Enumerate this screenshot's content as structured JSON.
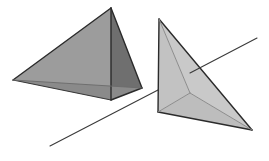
{
  "canvas": {
    "width": 269,
    "height": 161,
    "background": "#ffffff"
  },
  "palette": {
    "edge_dark": "#2b2b2b",
    "edge_mid": "#555555",
    "edge_light": "#8c8c8c",
    "line_stroke": "#3a3a3a",
    "left_face_left": "#9c9c9c",
    "left_face_right": "#6f6f6f",
    "left_face_bottom": "#8a8a8a",
    "right_face_upper": "#c9c9c9",
    "right_face_left": "#c2c2c2",
    "right_face_lower": "#bdbdbd",
    "right_face_sliver": "#b5b5b5"
  },
  "scene": {
    "title": "two-tetrahedra-with-intersecting-line",
    "description": "Two shaded tetrahedra in oblique projection with a single straight line crossing the scene from lower-left to upper-right."
  },
  "objects": {
    "left_tetrahedron": {
      "name": "left-tetrahedron",
      "vertices": {
        "apex": [
          111,
          8
        ],
        "left": [
          13,
          80
        ],
        "front": [
          111,
          100
        ],
        "right": [
          142,
          88
        ]
      },
      "faces": [
        {
          "name": "left-face",
          "points": "111,8 13,80 111,100",
          "fill": "#9c9c9c"
        },
        {
          "name": "right-face",
          "points": "111,8 111,100 142,88",
          "fill": "#6f6f6f"
        },
        {
          "name": "bottom-sliver-face",
          "points": "13,80 111,100 142,88",
          "fill": "#8a8a8a"
        }
      ],
      "edges": [
        {
          "name": "apex-to-left",
          "from": [
            111,
            8
          ],
          "to": [
            13,
            80
          ],
          "stroke": "#2b2b2b",
          "width": 1.4
        },
        {
          "name": "apex-to-front",
          "from": [
            111,
            8
          ],
          "to": [
            111,
            100
          ],
          "stroke": "#2b2b2b",
          "width": 1.4
        },
        {
          "name": "apex-to-right",
          "from": [
            111,
            8
          ],
          "to": [
            142,
            88
          ],
          "stroke": "#2b2b2b",
          "width": 1.4
        },
        {
          "name": "left-to-front",
          "from": [
            13,
            80
          ],
          "to": [
            111,
            100
          ],
          "stroke": "#3a3a3a",
          "width": 1.1
        },
        {
          "name": "front-to-right",
          "from": [
            111,
            100
          ],
          "to": [
            142,
            88
          ],
          "stroke": "#2b2b2b",
          "width": 1.4
        },
        {
          "name": "left-to-right-hidden",
          "from": [
            13,
            80
          ],
          "to": [
            142,
            88
          ],
          "stroke": "#6b6b6b",
          "width": 0.9
        }
      ]
    },
    "right_tetrahedron": {
      "name": "right-tetrahedron",
      "vertices": {
        "top": [
          159,
          19
        ],
        "bottom_left": [
          158,
          112
        ],
        "bottom_right": [
          252,
          130
        ],
        "interior": [
          190,
          93
        ]
      },
      "faces": [
        {
          "name": "upper-face",
          "points": "159,19 252,130 190,93",
          "fill": "#c9c9c9"
        },
        {
          "name": "left-face",
          "points": "159,19 158,112 190,93",
          "fill": "#c2c2c2"
        },
        {
          "name": "lower-face",
          "points": "158,112 252,130 190,93",
          "fill": "#bdbdbd"
        }
      ],
      "edges": [
        {
          "name": "top-to-bottom-left",
          "from": [
            159,
            19
          ],
          "to": [
            158,
            112
          ],
          "stroke": "#2b2b2b",
          "width": 1.4
        },
        {
          "name": "top-to-bottom-right",
          "from": [
            159,
            19
          ],
          "to": [
            252,
            130
          ],
          "stroke": "#2b2b2b",
          "width": 1.4
        },
        {
          "name": "bottom-left-to-bottom-right",
          "from": [
            158,
            112
          ],
          "to": [
            252,
            130
          ],
          "stroke": "#2b2b2b",
          "width": 1.4
        },
        {
          "name": "interior-to-top",
          "from": [
            190,
            93
          ],
          "to": [
            159,
            19
          ],
          "stroke": "#8c8c8c",
          "width": 1.0
        },
        {
          "name": "interior-to-bottom-left",
          "from": [
            190,
            93
          ],
          "to": [
            158,
            112
          ],
          "stroke": "#8c8c8c",
          "width": 1.0
        },
        {
          "name": "interior-to-bottom-right",
          "from": [
            190,
            93
          ],
          "to": [
            252,
            130
          ],
          "stroke": "#8c8c8c",
          "width": 1.0
        }
      ]
    },
    "crossing_line": {
      "name": "crossing-line",
      "from": [
        50,
        146
      ],
      "to": [
        257,
        38
      ],
      "stroke": "#3a3a3a",
      "width": 1.1,
      "occluded_segment": {
        "from": [
          158,
          90
        ],
        "to": [
          190,
          93
        ]
      }
    }
  },
  "chart_data": {
    "type": "scatter",
    "xlabel": "",
    "ylabel": "",
    "series": [
      {
        "name": "left-tetrahedron-vertices",
        "points": [
          [
            111,
            8
          ],
          [
            13,
            80
          ],
          [
            111,
            100
          ],
          [
            142,
            88
          ]
        ]
      },
      {
        "name": "right-tetrahedron-vertices",
        "points": [
          [
            159,
            19
          ],
          [
            158,
            112
          ],
          [
            252,
            130
          ],
          [
            190,
            93
          ]
        ]
      },
      {
        "name": "crossing-line-endpoints",
        "points": [
          [
            50,
            146
          ],
          [
            257,
            38
          ]
        ]
      }
    ],
    "xlim": [
      0,
      269
    ],
    "ylim": [
      161,
      0
    ],
    "grid": false,
    "legend": "none"
  }
}
